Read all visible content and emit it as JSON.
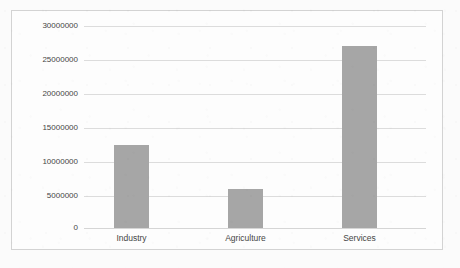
{
  "chart_data": {
    "type": "bar",
    "title": "",
    "subtitle": "",
    "xlabel": "",
    "ylabel": "",
    "categories": [
      "Industry",
      "Agriculture",
      "Services"
    ],
    "values": [
      12350000,
      5800000,
      27000000
    ],
    "series": [
      {
        "name": "",
        "values": [
          12350000,
          5800000,
          27000000
        ]
      }
    ],
    "ylim": [
      0,
      30000000
    ],
    "y_tick_step": 5000000,
    "y_ticks": [
      "0",
      "5000000",
      "10000000",
      "15000000",
      "20000000",
      "25000000",
      "30000000"
    ],
    "y_tick_values": [
      0,
      5000000,
      10000000,
      15000000,
      20000000,
      25000000,
      30000000
    ],
    "grid": true,
    "grid_axis": "y",
    "legend": false,
    "legend_position": "none",
    "orientation": "vertical",
    "bar_color": "#A6A6A6",
    "gridline_color": "#DCDCDC",
    "border_color": "#D3D3D3",
    "text_color": "#454545",
    "plot_background": "#FDFDFD"
  }
}
